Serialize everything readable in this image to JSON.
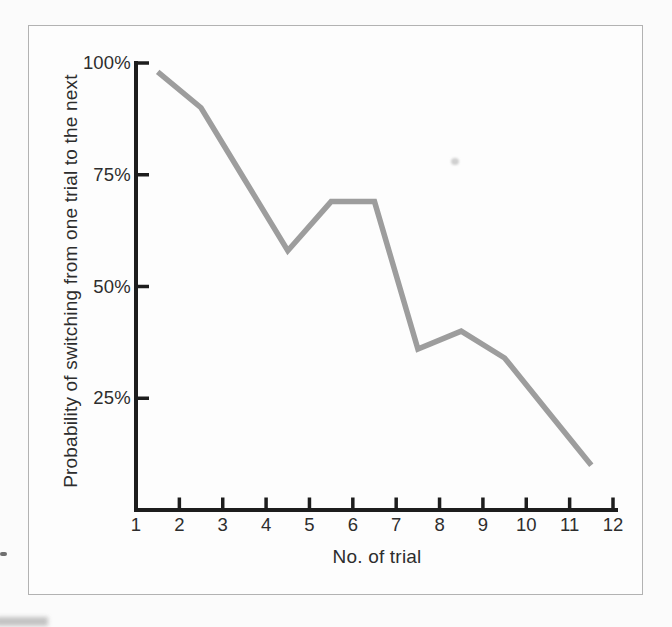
{
  "figure": {
    "background_color": "#fbfbfb",
    "frame_border_color": "#b2b2b2",
    "text_color": "#2d2d2d"
  },
  "chart_data": {
    "type": "line",
    "title": "",
    "xlabel": "No. of trial",
    "ylabel": "Probability of switching from one trial to the next",
    "series": [
      {
        "name": "probability of switching",
        "x": [
          1.5,
          2.5,
          3.5,
          4.5,
          5.5,
          6.5,
          7.5,
          8.5,
          9.5,
          10.5,
          11.5
        ],
        "y": [
          98,
          90,
          74,
          58,
          69,
          69,
          36,
          40,
          34,
          22,
          10
        ]
      }
    ],
    "xlim": [
      1,
      12
    ],
    "ylim": [
      0,
      100
    ],
    "x_ticks": [
      1,
      2,
      3,
      4,
      5,
      6,
      7,
      8,
      9,
      10,
      11,
      12
    ],
    "x_tick_labels": [
      "1",
      "2",
      "3",
      "4",
      "5",
      "6",
      "7",
      "8",
      "9",
      "10",
      "11",
      "12"
    ],
    "y_ticks": [
      100,
      75,
      50,
      25
    ],
    "y_tick_labels": [
      "100%",
      "75%",
      "50%",
      "25%"
    ],
    "grid": false,
    "legend": false,
    "line_color": "#9d9d9d",
    "line_width": 5.5,
    "axis_color": "#1d1d1d"
  }
}
